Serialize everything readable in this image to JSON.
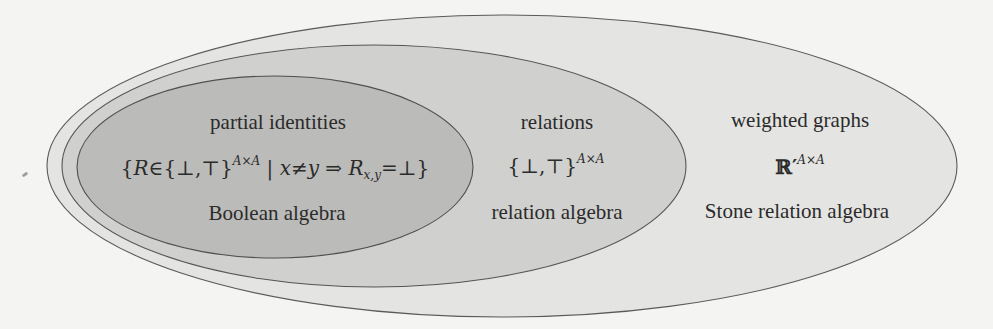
{
  "diagram": {
    "type": "nested-sets (Euler diagram)",
    "colors": {
      "background": "#f4f4f2",
      "outer_fill": "#e4e4e2",
      "middle_fill": "#cfcfcd",
      "inner_fill": "#b9b9b7",
      "stroke": "#555555",
      "text": "#2b2b2b"
    },
    "sets": [
      {
        "id": "weighted-graphs",
        "title": "weighted graphs",
        "formula_base": "ℝ′",
        "formula_sup": "A×A",
        "structure": "Stone relation algebra"
      },
      {
        "id": "relations",
        "title": "relations",
        "formula_base": "{⊥,⊤}",
        "formula_sup": "A×A",
        "structure": "relation algebra"
      },
      {
        "id": "partial-identities",
        "title": "partial identities",
        "formula_parts": {
          "open": "{",
          "var": "R",
          "elem": "∈{⊥,⊤}",
          "sup": "A×A",
          "cond": " | ",
          "x": "x",
          "neq": "≠",
          "y": "y",
          "implies": " ⇒ ",
          "R2": "R",
          "sub": "x,y",
          "eq": "=⊥}"
        },
        "formula_text": "{R∈{⊥,⊤}^(A×A) | x≠y ⇒ R_(x,y)=⊥}",
        "structure": "Boolean algebra"
      }
    ]
  }
}
